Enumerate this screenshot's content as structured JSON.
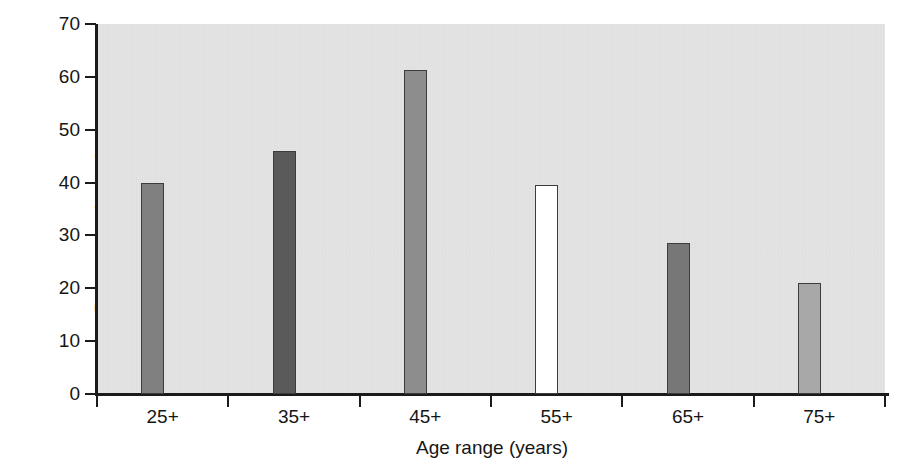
{
  "chart_data": {
    "type": "bar",
    "title": "",
    "xlabel": "Age range (years)",
    "ylabel": "Percentage incontinence",
    "categories": [
      "25+",
      "35+",
      "45+",
      "55+",
      "65+",
      "75+"
    ],
    "values": [
      40.0,
      46.0,
      61.3,
      39.6,
      28.6,
      21.0
    ],
    "ylim": [
      0,
      70
    ],
    "yticks": [
      0,
      10,
      20,
      30,
      40,
      50,
      60,
      70
    ],
    "ytick_labels": [
      "0",
      "10",
      "20",
      "30",
      "40",
      "50",
      "60",
      "70"
    ],
    "grid": false,
    "legend": "none",
    "bar_colors": [
      "#808080",
      "#5a5a5a",
      "#8d8d8d",
      "#ffffff",
      "#777777",
      "#a8a8a8"
    ],
    "bar_edge_color": "#3c3c3c",
    "plot_background": "#e4e4e4",
    "figure_background": "#ffffff",
    "axis_color": "#1b1b1b"
  }
}
